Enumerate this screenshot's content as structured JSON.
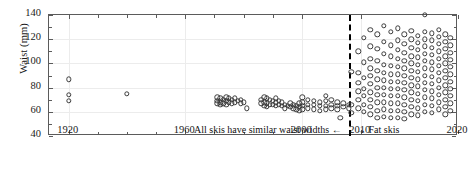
{
  "chart_data": {
    "type": "scatter",
    "title": "",
    "xlabel": "",
    "ylabel": "Waist (mm)",
    "xlim": [
      1915,
      2020
    ],
    "ylim": [
      40,
      140
    ],
    "grid": true,
    "legend": null,
    "yticks": [
      40,
      60,
      80,
      100,
      120,
      140
    ],
    "ytick_labels": [
      "40",
      "60",
      "80",
      "100",
      "120",
      "140"
    ],
    "xticks": [
      1920,
      1960,
      2000,
      2010,
      2020
    ],
    "xtick_labels": [
      "1920",
      "1960",
      "2000",
      "2010",
      "2020"
    ],
    "marker": "open-circle",
    "marker_color": "#3c3c3c",
    "annotations": [
      {
        "text": "All skis have similar waist widths ←",
        "x": 1963,
        "y": 44,
        "align": "left"
      },
      {
        "text": "→ Fat skis",
        "x": 2009.2,
        "y": 44,
        "align": "left"
      }
    ],
    "reference_lines": [
      {
        "orientation": "vertical",
        "x": 2008,
        "style": "dashed",
        "color": "#000000"
      }
    ],
    "series": [
      {
        "name": "Ski waist width by model year",
        "points": [
          [
            1920,
            87
          ],
          [
            1920,
            74
          ],
          [
            1920,
            69
          ],
          [
            1940,
            75
          ],
          [
            1971,
            72
          ],
          [
            1971,
            69
          ],
          [
            1971,
            67
          ],
          [
            1972,
            71
          ],
          [
            1972,
            68
          ],
          [
            1972,
            66
          ],
          [
            1973,
            70
          ],
          [
            1973,
            67
          ],
          [
            1974,
            72
          ],
          [
            1974,
            69
          ],
          [
            1974,
            66
          ],
          [
            1975,
            71
          ],
          [
            1975,
            68
          ],
          [
            1976,
            70
          ],
          [
            1976,
            67
          ],
          [
            1977,
            71
          ],
          [
            1977,
            68
          ],
          [
            1978,
            69
          ],
          [
            1979,
            70
          ],
          [
            1979,
            67
          ],
          [
            1980,
            68
          ],
          [
            1981,
            63
          ],
          [
            1986,
            70
          ],
          [
            1986,
            67
          ],
          [
            1987,
            72
          ],
          [
            1987,
            68
          ],
          [
            1987,
            65
          ],
          [
            1988,
            71
          ],
          [
            1988,
            67
          ],
          [
            1988,
            64
          ],
          [
            1989,
            70
          ],
          [
            1989,
            66
          ],
          [
            1990,
            69
          ],
          [
            1990,
            66
          ],
          [
            1991,
            71
          ],
          [
            1991,
            68
          ],
          [
            1991,
            65
          ],
          [
            1992,
            69
          ],
          [
            1992,
            66
          ],
          [
            1993,
            68
          ],
          [
            1993,
            65
          ],
          [
            1994,
            66
          ],
          [
            1994,
            63
          ],
          [
            1995,
            65
          ],
          [
            1996,
            67
          ],
          [
            1996,
            64
          ],
          [
            1997,
            66
          ],
          [
            1997,
            63
          ],
          [
            1998,
            65
          ],
          [
            1998,
            62
          ],
          [
            1999,
            67
          ],
          [
            1999,
            64
          ],
          [
            1999,
            61
          ],
          [
            2000,
            72
          ],
          [
            2000,
            68
          ],
          [
            2000,
            65
          ],
          [
            2000,
            62
          ],
          [
            2001,
            70
          ],
          [
            2001,
            66
          ],
          [
            2001,
            63
          ],
          [
            2002,
            69
          ],
          [
            2002,
            66
          ],
          [
            2002,
            62
          ],
          [
            2003,
            68
          ],
          [
            2003,
            65
          ],
          [
            2003,
            61
          ],
          [
            2004,
            73
          ],
          [
            2004,
            69
          ],
          [
            2004,
            65
          ],
          [
            2004,
            62
          ],
          [
            2005,
            70
          ],
          [
            2005,
            66
          ],
          [
            2005,
            63
          ],
          [
            2006,
            68
          ],
          [
            2006,
            65
          ],
          [
            2006,
            62
          ],
          [
            2007,
            67
          ],
          [
            2007,
            64
          ],
          [
            2008,
            66
          ],
          [
            2008,
            63
          ],
          [
            2006.5,
            55
          ],
          [
            2008.4,
            93
          ],
          [
            2008.4,
            66
          ],
          [
            2008.4,
            59
          ],
          [
            2009.6,
            110
          ],
          [
            2009.6,
            92
          ],
          [
            2009.6,
            84
          ],
          [
            2009.6,
            77
          ],
          [
            2009.6,
            70
          ],
          [
            2009.6,
            63
          ],
          [
            2010.3,
            121
          ],
          [
            2010.3,
            101
          ],
          [
            2010.3,
            88
          ],
          [
            2010.3,
            79
          ],
          [
            2010.3,
            73
          ],
          [
            2010.3,
            66
          ],
          [
            2010.3,
            60
          ],
          [
            2011,
            128
          ],
          [
            2011,
            114
          ],
          [
            2011,
            104
          ],
          [
            2011,
            96
          ],
          [
            2011,
            90
          ],
          [
            2011,
            83
          ],
          [
            2011,
            76
          ],
          [
            2011,
            70
          ],
          [
            2011,
            64
          ],
          [
            2011,
            58
          ],
          [
            2011.7,
            124
          ],
          [
            2011.7,
            112
          ],
          [
            2011.7,
            102
          ],
          [
            2011.7,
            94
          ],
          [
            2011.7,
            87
          ],
          [
            2011.7,
            80
          ],
          [
            2011.7,
            74
          ],
          [
            2011.7,
            68
          ],
          [
            2011.7,
            61
          ],
          [
            2011.7,
            55
          ],
          [
            2012.4,
            131
          ],
          [
            2012.4,
            118
          ],
          [
            2012.4,
            108
          ],
          [
            2012.4,
            99
          ],
          [
            2012.4,
            92
          ],
          [
            2012.4,
            86
          ],
          [
            2012.4,
            80
          ],
          [
            2012.4,
            74
          ],
          [
            2012.4,
            68
          ],
          [
            2012.4,
            62
          ],
          [
            2012.4,
            56
          ],
          [
            2013.1,
            126
          ],
          [
            2013.1,
            115
          ],
          [
            2013.1,
            106
          ],
          [
            2013.1,
            98
          ],
          [
            2013.1,
            91
          ],
          [
            2013.1,
            85
          ],
          [
            2013.1,
            79
          ],
          [
            2013.1,
            73
          ],
          [
            2013.1,
            67
          ],
          [
            2013.1,
            61
          ],
          [
            2013.1,
            55
          ],
          [
            2013.8,
            129
          ],
          [
            2013.8,
            119
          ],
          [
            2013.8,
            111
          ],
          [
            2013.8,
            104
          ],
          [
            2013.8,
            97
          ],
          [
            2013.8,
            91
          ],
          [
            2013.8,
            85
          ],
          [
            2013.8,
            79
          ],
          [
            2013.8,
            73
          ],
          [
            2013.8,
            67
          ],
          [
            2013.8,
            61
          ],
          [
            2013.8,
            55
          ],
          [
            2014.5,
            124
          ],
          [
            2014.5,
            116
          ],
          [
            2014.5,
            109
          ],
          [
            2014.5,
            102
          ],
          [
            2014.5,
            96
          ],
          [
            2014.5,
            90
          ],
          [
            2014.5,
            84
          ],
          [
            2014.5,
            78
          ],
          [
            2014.5,
            72
          ],
          [
            2014.5,
            66
          ],
          [
            2014.5,
            60
          ],
          [
            2014.5,
            54
          ],
          [
            2015.2,
            127
          ],
          [
            2015.2,
            120
          ],
          [
            2015.2,
            113
          ],
          [
            2015.2,
            106
          ],
          [
            2015.2,
            100
          ],
          [
            2015.2,
            94
          ],
          [
            2015.2,
            88
          ],
          [
            2015.2,
            82
          ],
          [
            2015.2,
            76
          ],
          [
            2015.2,
            70
          ],
          [
            2015.2,
            64
          ],
          [
            2015.2,
            58
          ],
          [
            2015.9,
            123
          ],
          [
            2015.9,
            117
          ],
          [
            2015.9,
            111
          ],
          [
            2015.9,
            105
          ],
          [
            2015.9,
            99
          ],
          [
            2015.9,
            93
          ],
          [
            2015.9,
            87
          ],
          [
            2015.9,
            81
          ],
          [
            2015.9,
            75
          ],
          [
            2015.9,
            69
          ],
          [
            2015.9,
            63
          ],
          [
            2015.9,
            57
          ],
          [
            2016.6,
            126
          ],
          [
            2016.6,
            120
          ],
          [
            2016.6,
            114
          ],
          [
            2016.6,
            108
          ],
          [
            2016.6,
            102
          ],
          [
            2016.6,
            96
          ],
          [
            2016.6,
            90
          ],
          [
            2016.6,
            84
          ],
          [
            2016.6,
            78
          ],
          [
            2016.6,
            72
          ],
          [
            2016.6,
            66
          ],
          [
            2016.6,
            60
          ],
          [
            2016.6,
            140
          ],
          [
            2017.3,
            125
          ],
          [
            2017.3,
            119
          ],
          [
            2017.3,
            113
          ],
          [
            2017.3,
            107
          ],
          [
            2017.3,
            101
          ],
          [
            2017.3,
            95
          ],
          [
            2017.3,
            89
          ],
          [
            2017.3,
            83
          ],
          [
            2017.3,
            77
          ],
          [
            2017.3,
            71
          ],
          [
            2017.3,
            65
          ],
          [
            2017.3,
            59
          ],
          [
            2018,
            128
          ],
          [
            2018,
            122
          ],
          [
            2018,
            116
          ],
          [
            2018,
            110
          ],
          [
            2018,
            104
          ],
          [
            2018,
            98
          ],
          [
            2018,
            92
          ],
          [
            2018,
            86
          ],
          [
            2018,
            80
          ],
          [
            2018,
            74
          ],
          [
            2018,
            68
          ],
          [
            2018,
            62
          ],
          [
            2018.7,
            124
          ],
          [
            2018.7,
            118
          ],
          [
            2018.7,
            112
          ],
          [
            2018.7,
            106
          ],
          [
            2018.7,
            100
          ],
          [
            2018.7,
            94
          ],
          [
            2018.7,
            88
          ],
          [
            2018.7,
            82
          ],
          [
            2018.7,
            76
          ],
          [
            2018.7,
            70
          ],
          [
            2018.7,
            64
          ],
          [
            2018.7,
            58
          ],
          [
            2019.2,
            121
          ],
          [
            2019.2,
            115
          ],
          [
            2019.2,
            109
          ],
          [
            2019.2,
            103
          ],
          [
            2019.2,
            97
          ],
          [
            2019.2,
            91
          ],
          [
            2019.2,
            85
          ],
          [
            2019.2,
            79
          ],
          [
            2019.2,
            73
          ],
          [
            2019.2,
            67
          ],
          [
            2019.2,
            61
          ]
        ]
      }
    ]
  }
}
